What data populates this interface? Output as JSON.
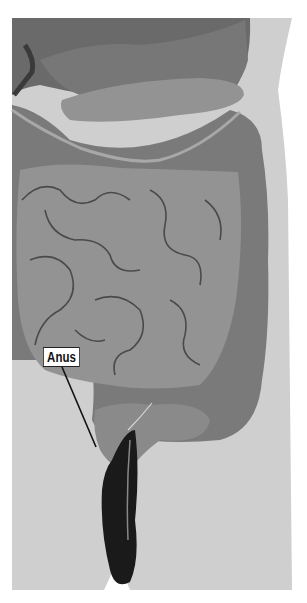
{
  "figure": {
    "labels": [
      {
        "text": "Anus",
        "box": {
          "x": 43,
          "y": 347
        },
        "leader_to": {
          "x": 96,
          "y": 447
        }
      }
    ]
  },
  "colors": {
    "background": "#ffffff",
    "body": "#cfcfcf",
    "organ_dark": "#6e6e6e",
    "organ_mid": "#8a8a8a",
    "small_intestine": "#939393",
    "intestine_lines": "#4a4a4a",
    "rectum": "#1a1a1a"
  }
}
